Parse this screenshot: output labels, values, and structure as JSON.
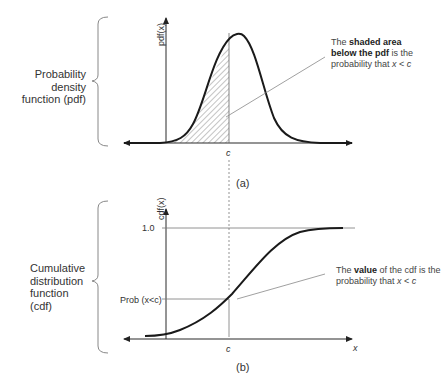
{
  "panel_a": {
    "side_label_line1": "Probability density",
    "side_label_line2": "function (pdf)",
    "y_axis_label": "pdf(x)",
    "x_marker": "c",
    "caption": "(a)",
    "annotation": {
      "pre": "The ",
      "bold1": "shaded area",
      "bold2": "below the pdf",
      "post1": " is the",
      "line3": "probability that ",
      "var": "x",
      "rel": " < ",
      "var2": "c"
    }
  },
  "panel_b": {
    "side_label_line1": "Cumulative",
    "side_label_line2": "distribution",
    "side_label_line3": "function (cdf)",
    "y_axis_label": "cdf(x)",
    "y_tick_top": "1.0",
    "y_tick_prob": "Prob (x<c)",
    "x_marker": "c",
    "x_axis_label": "x",
    "caption": "(b)",
    "annotation": {
      "pre": "The ",
      "bold": "value",
      "post": " of the cdf is the",
      "line2": "probability that ",
      "var": "x",
      "rel": " < ",
      "var2": "c"
    }
  },
  "colors": {
    "curve": "#1a1a1a",
    "axis": "#2a2a2a",
    "guide": "#777777",
    "text": "#333333"
  }
}
